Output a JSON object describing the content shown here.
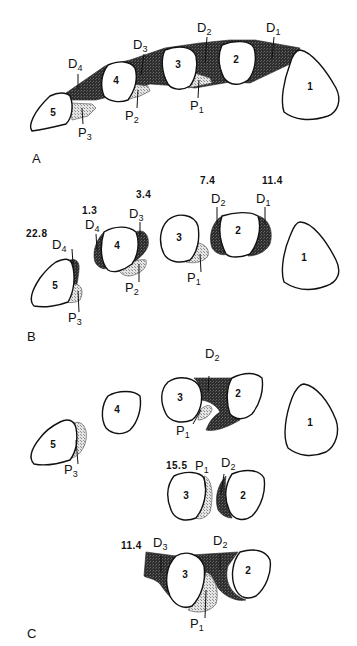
{
  "figure": {
    "panels": [
      {
        "id": "A",
        "label": "A",
        "bones": [
          "1",
          "2",
          "3",
          "4",
          "5"
        ],
        "labels": {
          "D1": {
            "main": "D",
            "sub": "1"
          },
          "D2": {
            "main": "D",
            "sub": "2"
          },
          "D3": {
            "main": "D",
            "sub": "3"
          },
          "D4": {
            "main": "D",
            "sub": "4"
          },
          "P1": {
            "main": "P",
            "sub": "1"
          },
          "P2": {
            "main": "P",
            "sub": "2"
          },
          "P3": {
            "main": "P",
            "sub": "3"
          }
        }
      },
      {
        "id": "B",
        "label": "B",
        "bones": [
          "1",
          "2",
          "3",
          "4",
          "5"
        ],
        "labels": {
          "D1": {
            "main": "D",
            "sub": "1"
          },
          "D2": {
            "main": "D",
            "sub": "2"
          },
          "D3": {
            "main": "D",
            "sub": "3"
          },
          "D4a": {
            "main": "D",
            "sub": "4"
          },
          "D4b": {
            "main": "D",
            "sub": "4"
          },
          "P1": {
            "main": "P",
            "sub": "1"
          },
          "P2": {
            "main": "P",
            "sub": "2"
          },
          "P3": {
            "main": "P",
            "sub": "3"
          }
        },
        "values": {
          "v1": "22.8",
          "v2": "1.3",
          "v3": "3.4",
          "v4": "7.4",
          "v5": "11.4"
        }
      },
      {
        "id": "C",
        "label": "C",
        "bones": [
          "1",
          "2",
          "3",
          "4",
          "5"
        ],
        "labels": {
          "P3": {
            "main": "P",
            "sub": "3"
          },
          "D2_top": {
            "main": "D",
            "sub": "2"
          },
          "P1_top": {
            "main": "P",
            "sub": "1"
          },
          "P1_mid": {
            "main": "P",
            "sub": "1"
          },
          "D2_mid": {
            "main": "D",
            "sub": "2"
          },
          "D3_bot": {
            "main": "D",
            "sub": "3"
          },
          "D2_bot": {
            "main": "D",
            "sub": "2"
          },
          "P1_bot": {
            "main": "P",
            "sub": "1"
          }
        },
        "values": {
          "mid": "15.5",
          "bot": "11.4"
        },
        "sub_bones": {
          "mid": [
            "3",
            "2"
          ],
          "bot": [
            "3",
            "2"
          ]
        }
      }
    ],
    "legend_colors": {
      "dark_region": "#2a2a2a",
      "stippled_region": "#cfcfcf",
      "outline": "#111111"
    }
  }
}
